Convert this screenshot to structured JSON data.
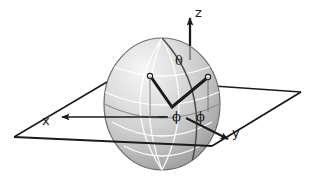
{
  "figure": {
    "kind": "spherical-coordinate-diagram",
    "background_color": "#ffffff",
    "ink_color": "#1a1a1a",
    "sphere": {
      "fill_light": "#f2f2f2",
      "fill_mid": "#c9c9c9",
      "fill_dark": "#9a9a9a",
      "outline_color": "#6e6e6e",
      "gridline_color": "#ffffff",
      "meridian_color": "#4a4a4a",
      "center_x": 162,
      "center_y": 104,
      "radius_x": 58,
      "radius_y": 66
    },
    "plane": {
      "stroke_color": "#1a1a1a",
      "fill": "none",
      "corners": [
        {
          "x": 14,
          "y": 137
        },
        {
          "x": 112,
          "y": 79
        },
        {
          "x": 301,
          "y": 92
        },
        {
          "x": 212,
          "y": 146
        }
      ]
    },
    "vectors": {
      "vertex": {
        "x": 172,
        "y": 107
      },
      "endpoint_left": {
        "x": 150,
        "y": 76
      },
      "endpoint_right": {
        "x": 208,
        "y": 77
      },
      "stroke_width": 3,
      "node_fill": "#ffffff",
      "node_stroke": "#1a1a1a",
      "node_radius": 2.6
    },
    "axes": {
      "z": {
        "from": {
          "x": 190,
          "y": 60
        },
        "to": {
          "x": 190,
          "y": 16
        }
      },
      "x": {
        "from": {
          "x": 162,
          "y": 118
        },
        "to": {
          "x": 60,
          "y": 118
        }
      },
      "y": {
        "from": {
          "x": 188,
          "y": 119
        },
        "to": {
          "x": 228,
          "y": 139
        }
      }
    }
  },
  "labels": {
    "z_axis": "z",
    "x_axis": "x",
    "y_axis": "y",
    "polar_angle": "θ",
    "azimuth_angle": "ϕ",
    "negative_azimuth_angle": "− ϕ"
  },
  "icons": {
    "arrowhead": "arrowhead-icon",
    "vector_node": "vector-endpoint-node-icon"
  }
}
